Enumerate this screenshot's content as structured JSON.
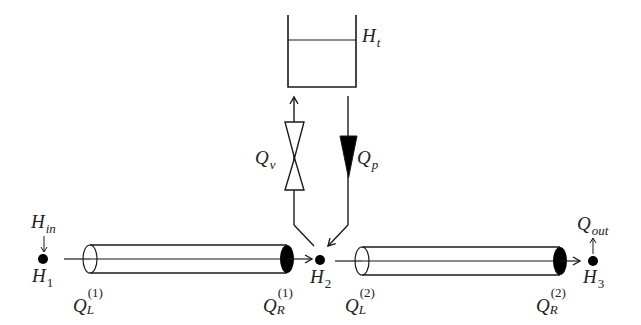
{
  "diagram": {
    "type": "hydraulic network schematic",
    "colors": {
      "stroke": "#1a1a1a",
      "fill": "#000000",
      "background": "#ffffff"
    },
    "tank": {
      "label_main": "H",
      "label_sub": "t"
    },
    "valve": {
      "label_main": "Q",
      "label_sub": "v"
    },
    "pump": {
      "label_main": "Q",
      "label_sub": "p"
    },
    "nodes": [
      {
        "id": "H1",
        "label_main": "H",
        "label_sub": "1"
      },
      {
        "id": "H2",
        "label_main": "H",
        "label_sub": "2"
      },
      {
        "id": "H3",
        "label_main": "H",
        "label_sub": "3"
      }
    ],
    "inflow": {
      "label_main": "H",
      "label_sub": "in"
    },
    "outflow": {
      "label_main": "Q",
      "label_sub": "out"
    },
    "pipes": [
      {
        "id": "pipe-1",
        "left_label": {
          "main": "Q",
          "sub": "L",
          "sup": "(1)"
        },
        "right_label": {
          "main": "Q",
          "sub": "R",
          "sup": "(1)"
        }
      },
      {
        "id": "pipe-2",
        "left_label": {
          "main": "Q",
          "sub": "L",
          "sup": "(2)"
        },
        "right_label": {
          "main": "Q",
          "sub": "R",
          "sup": "(2)"
        }
      }
    ]
  }
}
